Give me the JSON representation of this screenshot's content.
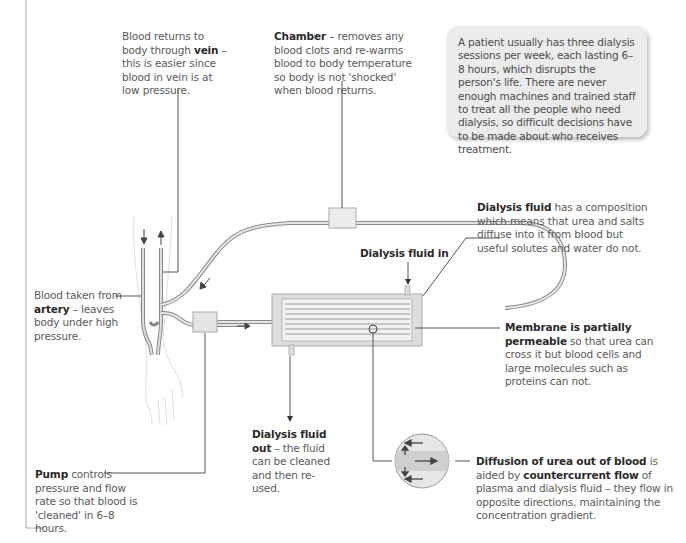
{
  "note_box": {
    "text": "A patient usually has three dialysis sessions per week, each lasting 6–8 hours, which disrupts the person's life. There are never enough machines and trained staff to treat all the people who need dialysis, so difficult decisions have to be made about who receives treatment."
  },
  "labels": {
    "vein": {
      "pre": "Blood returns to body through ",
      "bold": "vein",
      "post": " – this is easier since blood in vein is at low pressure."
    },
    "chamber": {
      "bold": "Chamber",
      "post": " – removes any blood clots and re-warms blood to body temperature so body is not 'shocked' when blood returns."
    },
    "dialysis_fluid": {
      "bold": "Dialysis fluid",
      "post": " has a composition which means that urea and salts diffuse into it from blood but useful solutes and water do not."
    },
    "fluid_in": {
      "bold": "Dialysis fluid in"
    },
    "artery": {
      "pre": "Blood taken from ",
      "bold": "artery",
      "post": " – leaves body under high pressure."
    },
    "membrane": {
      "bold": "Membrane is partially permeable",
      "post": " so that urea can cross it but blood cells and large molecules such as proteins can not."
    },
    "fluid_out": {
      "bold": "Dialysis fluid out",
      "post": " – the fluid can be cleaned and then re-used."
    },
    "pump": {
      "bold": "Pump",
      "post": " controls pressure and flow rate so that blood is 'cleaned' in 6–8 hours."
    },
    "diffusion": {
      "bold1": "Diffusion of urea out of blood",
      "mid": " is aided by ",
      "bold2": "countercurrent flow",
      "post": " of plasma and dialysis fluid – they flow in opposite directions, maintaining the concentration gradient."
    }
  },
  "colors": {
    "tube": "#9a9a9a",
    "tube_fill": "#dcdcdc",
    "box_fill": "#e4e4e4",
    "line": "#555555",
    "text": "#5a5a5a",
    "bold": "#2a2a2a"
  }
}
